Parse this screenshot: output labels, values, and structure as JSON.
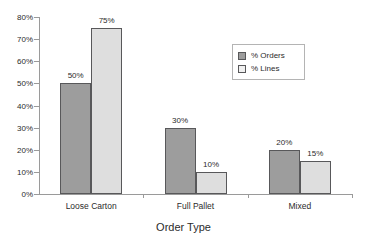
{
  "chart_data": {
    "type": "bar",
    "title": "",
    "subtitle": "",
    "xlabel": "Order Type",
    "ylabel": "",
    "categories": [
      "Loose Carton",
      "Full Pallet",
      "Mixed"
    ],
    "series": [
      {
        "name": "% Orders",
        "color": "#9d9d9d",
        "values": [
          50,
          30,
          20
        ],
        "labels": [
          "50%",
          "30%",
          "20%"
        ]
      },
      {
        "name": "% Lines",
        "color": "#dedede",
        "values": [
          75,
          10,
          15
        ],
        "labels": [
          "75%",
          "10%",
          "15%"
        ]
      }
    ],
    "ylim": [
      0,
      80
    ],
    "ytick_values": [
      0,
      10,
      20,
      30,
      40,
      50,
      60,
      70,
      80
    ],
    "ytick_labels": [
      "0%",
      "10%",
      "20%",
      "30%",
      "40%",
      "50%",
      "60%",
      "70%",
      "80%"
    ],
    "grid": false,
    "legend_position": "upper-right",
    "data_labels": true
  },
  "legend": {
    "entries": [
      {
        "label": "% Orders",
        "swatch": "dark-gray-swatch"
      },
      {
        "label": "% Lines",
        "swatch": "light-gray-swatch"
      }
    ]
  },
  "axis": {
    "x_title": "Order Type"
  }
}
